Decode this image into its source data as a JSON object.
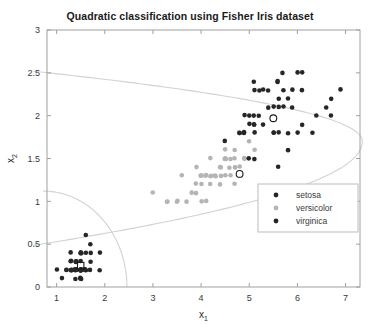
{
  "chart_data": {
    "type": "scatter",
    "title": "Quadratic classification using Fisher Iris dataset",
    "xlabel": "x_1",
    "xlabel_base": "x",
    "xlabel_sub": "1",
    "ylabel": "x_2",
    "ylabel_base": "x",
    "ylabel_sub": "2",
    "xlim": [
      0.8,
      7.3
    ],
    "ylim": [
      0,
      3
    ],
    "xticks": [
      1,
      2,
      3,
      4,
      5,
      6,
      7
    ],
    "yticks": [
      0,
      0.5,
      1,
      1.5,
      2,
      2.5,
      3
    ],
    "grid": false,
    "legend_position": "center-right",
    "colors": {
      "setosa": "#262626",
      "versicolor": "#b4b4b4",
      "virginica": "#262626",
      "boundary": "#d2d2d2",
      "axis": "#a0a0a0",
      "text": "#3a3a3a"
    },
    "series": [
      {
        "name": "setosa",
        "color": "#262626",
        "marker": "filled-circle",
        "points": [
          [
            1.4,
            0.2
          ],
          [
            1.4,
            0.2
          ],
          [
            1.3,
            0.2
          ],
          [
            1.5,
            0.2
          ],
          [
            1.4,
            0.2
          ],
          [
            1.7,
            0.4
          ],
          [
            1.4,
            0.3
          ],
          [
            1.5,
            0.2
          ],
          [
            1.4,
            0.2
          ],
          [
            1.5,
            0.1
          ],
          [
            1.5,
            0.2
          ],
          [
            1.6,
            0.2
          ],
          [
            1.4,
            0.1
          ],
          [
            1.1,
            0.1
          ],
          [
            1.2,
            0.2
          ],
          [
            1.5,
            0.4
          ],
          [
            1.3,
            0.4
          ],
          [
            1.4,
            0.3
          ],
          [
            1.7,
            0.3
          ],
          [
            1.5,
            0.3
          ],
          [
            1.7,
            0.2
          ],
          [
            1.5,
            0.4
          ],
          [
            1.0,
            0.2
          ],
          [
            1.7,
            0.5
          ],
          [
            1.9,
            0.2
          ],
          [
            1.6,
            0.2
          ],
          [
            1.6,
            0.4
          ],
          [
            1.5,
            0.2
          ],
          [
            1.4,
            0.2
          ],
          [
            1.6,
            0.2
          ],
          [
            1.6,
            0.2
          ],
          [
            1.5,
            0.4
          ],
          [
            1.5,
            0.1
          ],
          [
            1.4,
            0.2
          ],
          [
            1.5,
            0.2
          ],
          [
            1.2,
            0.2
          ],
          [
            1.3,
            0.2
          ],
          [
            1.5,
            0.1
          ],
          [
            1.3,
            0.2
          ],
          [
            1.5,
            0.2
          ],
          [
            1.3,
            0.3
          ],
          [
            1.3,
            0.3
          ],
          [
            1.3,
            0.2
          ],
          [
            1.6,
            0.6
          ],
          [
            1.9,
            0.4
          ],
          [
            1.4,
            0.3
          ],
          [
            1.6,
            0.2
          ],
          [
            1.4,
            0.2
          ],
          [
            1.5,
            0.2
          ],
          [
            1.4,
            0.2
          ]
        ],
        "misclassified": [
          [
            1.5,
            0.25
          ]
        ]
      },
      {
        "name": "versicolor",
        "color": "#b4b4b4",
        "marker": "filled-circle",
        "points": [
          [
            4.7,
            1.4
          ],
          [
            4.5,
            1.5
          ],
          [
            4.9,
            1.5
          ],
          [
            4.0,
            1.3
          ],
          [
            4.6,
            1.5
          ],
          [
            4.5,
            1.3
          ],
          [
            4.7,
            1.6
          ],
          [
            3.3,
            1.0
          ],
          [
            4.6,
            1.3
          ],
          [
            3.9,
            1.4
          ],
          [
            3.5,
            1.0
          ],
          [
            4.2,
            1.5
          ],
          [
            4.0,
            1.0
          ],
          [
            4.7,
            1.4
          ],
          [
            3.6,
            1.3
          ],
          [
            4.4,
            1.4
          ],
          [
            4.5,
            1.5
          ],
          [
            4.1,
            1.0
          ],
          [
            4.5,
            1.5
          ],
          [
            3.9,
            1.1
          ],
          [
            4.8,
            1.8
          ],
          [
            4.0,
            1.3
          ],
          [
            4.9,
            1.5
          ],
          [
            4.7,
            1.2
          ],
          [
            4.3,
            1.3
          ],
          [
            4.4,
            1.4
          ],
          [
            4.8,
            1.4
          ],
          [
            5.0,
            1.7
          ],
          [
            4.5,
            1.5
          ],
          [
            3.5,
            1.0
          ],
          [
            3.8,
            1.1
          ],
          [
            3.7,
            1.0
          ],
          [
            3.9,
            1.2
          ],
          [
            5.1,
            1.6
          ],
          [
            4.5,
            1.5
          ],
          [
            4.5,
            1.6
          ],
          [
            4.7,
            1.5
          ],
          [
            4.4,
            1.3
          ],
          [
            4.1,
            1.3
          ],
          [
            4.0,
            1.3
          ],
          [
            4.4,
            1.2
          ],
          [
            4.6,
            1.4
          ],
          [
            4.0,
            1.2
          ],
          [
            3.3,
            1.0
          ],
          [
            4.2,
            1.3
          ],
          [
            4.2,
            1.2
          ],
          [
            4.2,
            1.3
          ],
          [
            4.3,
            1.3
          ],
          [
            3.0,
            1.1
          ],
          [
            4.1,
            1.3
          ]
        ],
        "misclassified": [
          [
            4.8,
            1.32
          ]
        ]
      },
      {
        "name": "virginica",
        "color": "#262626",
        "marker": "filled-circle",
        "points": [
          [
            6.0,
            2.5
          ],
          [
            5.1,
            1.9
          ],
          [
            5.9,
            2.1
          ],
          [
            5.6,
            1.8
          ],
          [
            5.8,
            2.2
          ],
          [
            6.6,
            2.1
          ],
          [
            4.5,
            1.7
          ],
          [
            6.3,
            1.8
          ],
          [
            5.8,
            1.8
          ],
          [
            6.1,
            2.5
          ],
          [
            5.1,
            2.0
          ],
          [
            5.3,
            1.9
          ],
          [
            5.5,
            2.1
          ],
          [
            5.0,
            2.0
          ],
          [
            5.1,
            2.4
          ],
          [
            5.3,
            2.3
          ],
          [
            5.5,
            1.8
          ],
          [
            6.7,
            2.2
          ],
          [
            6.9,
            2.3
          ],
          [
            5.0,
            1.5
          ],
          [
            5.7,
            2.3
          ],
          [
            4.9,
            2.0
          ],
          [
            6.7,
            2.0
          ],
          [
            4.9,
            1.8
          ],
          [
            5.7,
            2.1
          ],
          [
            6.0,
            1.8
          ],
          [
            4.8,
            1.8
          ],
          [
            4.9,
            1.8
          ],
          [
            5.6,
            2.1
          ],
          [
            5.8,
            1.6
          ],
          [
            6.1,
            1.9
          ],
          [
            6.4,
            2.0
          ],
          [
            5.6,
            2.2
          ],
          [
            5.1,
            1.5
          ],
          [
            5.6,
            1.4
          ],
          [
            6.1,
            2.3
          ],
          [
            5.6,
            2.4
          ],
          [
            5.5,
            1.8
          ],
          [
            4.8,
            1.8
          ],
          [
            5.4,
            2.1
          ],
          [
            5.6,
            2.4
          ],
          [
            5.1,
            2.3
          ],
          [
            5.1,
            1.9
          ],
          [
            5.9,
            2.3
          ],
          [
            5.7,
            2.5
          ],
          [
            5.2,
            2.3
          ],
          [
            5.0,
            1.9
          ],
          [
            5.2,
            2.0
          ],
          [
            5.4,
            2.3
          ],
          [
            5.1,
            1.8
          ]
        ],
        "misclassified": [
          [
            5.5,
            1.97
          ]
        ]
      }
    ],
    "boundaries": [
      {
        "name": "setosa-versicolor-ellipse"
      },
      {
        "name": "versicolor-virginica-parabola"
      }
    ]
  },
  "legend": {
    "entries": [
      {
        "label": "setosa",
        "color": "#262626"
      },
      {
        "label": "versicolor",
        "color": "#b4b4b4"
      },
      {
        "label": "virginica",
        "color": "#262626"
      }
    ]
  }
}
